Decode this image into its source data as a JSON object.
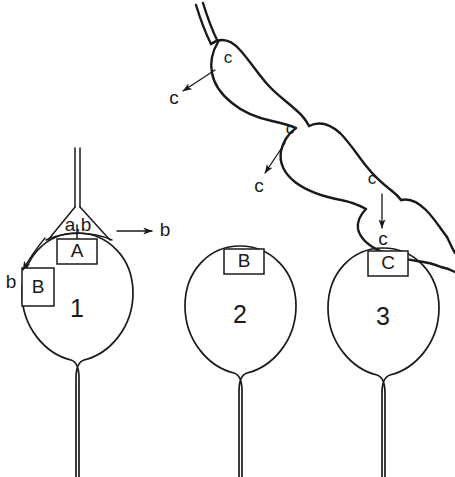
{
  "figure": {
    "background_color": "#ffffff",
    "ink_color": "#1a1a1a"
  },
  "chain": {
    "name": "filament-of-three-spindle-cells",
    "cells": [
      {
        "id": "chain-cell-1",
        "label": "c"
      },
      {
        "id": "chain-cell-2",
        "label": "c"
      },
      {
        "id": "chain-cell-3",
        "label": "c"
      }
    ],
    "callouts": [
      {
        "id": "chain-callout-1",
        "label": "c"
      },
      {
        "id": "chain-callout-2",
        "label": "c"
      },
      {
        "id": "chain-callout-3",
        "label": "c"
      }
    ]
  },
  "structures": [
    {
      "id": "structure-1",
      "number": "1",
      "triangle_label": "a,b",
      "boxes": [
        {
          "id": "box-a",
          "label": "A"
        },
        {
          "id": "box-b",
          "label": "B"
        }
      ],
      "callouts": [
        {
          "id": "callout-b-right",
          "label": "b"
        },
        {
          "id": "callout-b-left",
          "label": "b"
        }
      ]
    },
    {
      "id": "structure-2",
      "number": "2",
      "boxes": [
        {
          "id": "box-b",
          "label": "B"
        }
      ]
    },
    {
      "id": "structure-3",
      "number": "3",
      "boxes": [
        {
          "id": "box-c",
          "label": "C"
        }
      ]
    }
  ]
}
